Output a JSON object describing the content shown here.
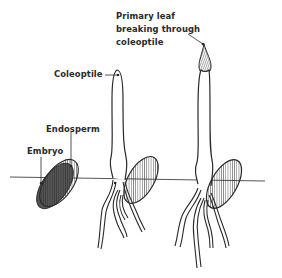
{
  "diagram": {
    "title": "",
    "stages": [
      {
        "id": "seed",
        "labels": [
          {
            "key": "endosperm",
            "text": "Endosperm"
          },
          {
            "key": "embryo",
            "text": "Embryo"
          }
        ]
      },
      {
        "id": "seedling-coleoptile",
        "labels": [
          {
            "key": "coleoptile",
            "text": "Coleoptile"
          }
        ]
      },
      {
        "id": "seedling-primary-leaf",
        "labels": [
          {
            "key": "primary_leaf",
            "text": [
              "Primary leaf",
              "breaking through",
              "coleoptile"
            ]
          }
        ]
      }
    ],
    "ground_line": true,
    "colors": {
      "ink": "#2a2a2a",
      "background": "#ffffff"
    }
  },
  "labels": {
    "endosperm": "Endosperm",
    "embryo": "Embryo",
    "coleoptile": "Coleoptile",
    "primary_leaf_1": "Primary leaf",
    "primary_leaf_2": "breaking through",
    "primary_leaf_3": "coleoptile"
  }
}
